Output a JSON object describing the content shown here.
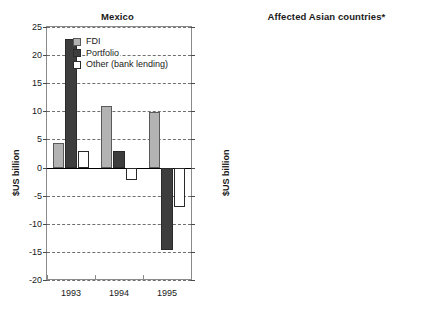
{
  "chart_data": [
    {
      "type": "bar",
      "title": "Mexico",
      "xlabel": "",
      "ylabel": "$US billion",
      "categories": [
        "1993",
        "1994",
        "1995"
      ],
      "ylim": [
        -20,
        25
      ],
      "yticks": [
        25,
        20,
        15,
        10,
        5,
        0,
        -5,
        -10,
        -15,
        -20
      ],
      "ytick_labels": [
        "25",
        "20",
        "15",
        "10",
        "5",
        "0",
        "-5",
        "-10",
        "-15",
        "-20"
      ],
      "grid": true,
      "legend_position": "top-center",
      "series": [
        {
          "name": "FDI",
          "color": "#b3b3b3",
          "values": [
            4.4,
            11.0,
            9.9
          ]
        },
        {
          "name": "Portfolio",
          "color": "#3d3d3d",
          "values": [
            22.8,
            3.0,
            -14.6
          ]
        },
        {
          "name": "Other (bank lending)",
          "color": "#ffffff",
          "values": [
            3.0,
            -2.3,
            -7.0
          ]
        }
      ]
    },
    {
      "type": "bar",
      "title": "Affected Asian countries*",
      "xlabel": "",
      "ylabel": "$US billion",
      "categories": [
        "1996",
        "1997"
      ],
      "ylim": [
        -40,
        40
      ],
      "yticks": [
        40,
        30,
        20,
        10,
        0,
        -10,
        -20,
        -30,
        -40
      ],
      "ytick_labels": [
        "40",
        "30",
        "20",
        "10",
        "0",
        "-10",
        "-20",
        "-30",
        "-40"
      ],
      "grid": true,
      "legend_position": "none",
      "series": [
        {
          "name": "FDI",
          "color": "#b3b3b3",
          "values": [
            11.0,
            10.0
          ]
        },
        {
          "name": "Portfolio",
          "color": "#3d3d3d",
          "values": [
            20.0,
            11.0
          ]
        },
        {
          "name": "Other (bank lending)",
          "color": "#ffffff",
          "values": [
            40.0,
            -32.0
          ]
        }
      ]
    }
  ],
  "legend": {
    "items": [
      {
        "label": "FDI",
        "key": "fdi"
      },
      {
        "label": "Portfolio",
        "key": "portfolio"
      },
      {
        "label": "Other (bank lending)",
        "key": "other"
      }
    ]
  }
}
